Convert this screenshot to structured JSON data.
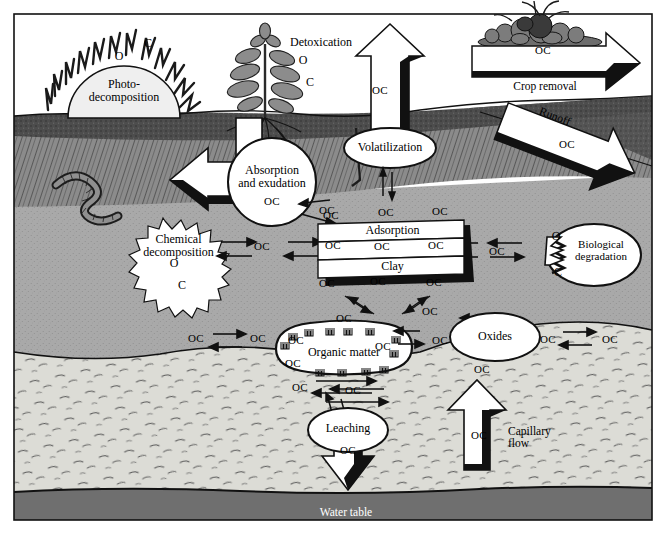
{
  "diagram": {
    "colors": {
      "surface_white": "#ffffff",
      "topsoil_dark": "#4a4a4a",
      "a_horizon": "#8e8e8e",
      "subsoil_mid": "#a8a8a8",
      "parent_material": "#d9d9d4",
      "water_table": "#6e6e6e",
      "outline": "#000000",
      "callout_fill": "#ffffff"
    },
    "layers": [
      {
        "name": "atmosphere",
        "label": ""
      },
      {
        "name": "topsoil",
        "label": ""
      },
      {
        "name": "a-horizon",
        "label": ""
      },
      {
        "name": "subsoil",
        "label": ""
      },
      {
        "name": "parent-material",
        "label": ""
      },
      {
        "name": "water-table",
        "label": "Water table"
      }
    ]
  },
  "processes": {
    "photo_decomposition": "Photo-\ndecomposition",
    "detoxication": "Detoxication",
    "volatilization": "Volatilization",
    "crop_removal": "Crop removal",
    "runoff": "Runoff",
    "absorption_exudation": "Absorption\nand exudation",
    "chemical_decomposition": "Chemical\ndecomposition",
    "adsorption": "Adsorption",
    "clay": "Clay",
    "biological_degradation": "Biological\ndegradation",
    "organic_matter": "Organic matter",
    "oxides": "Oxides",
    "leaching": "Leaching",
    "capillary_flow": "Capillary\nflow",
    "water_table": "Water table"
  },
  "atoms": {
    "o": "O",
    "c": "C"
  },
  "oc_label": "OC",
  "oc_labels": [
    {
      "id": "oc-volatilization-stack",
      "text": "OC",
      "x": 380,
      "y": 92
    },
    {
      "id": "oc-crop-removal",
      "text": "OC",
      "x": 543,
      "y": 52
    },
    {
      "id": "oc-runoff",
      "text": "OC",
      "x": 567,
      "y": 146
    },
    {
      "id": "oc-absorption",
      "text": "OC",
      "x": 272,
      "y": 203
    },
    {
      "id": "oc-absorption-right",
      "text": "OC",
      "x": 327,
      "y": 212
    },
    {
      "id": "oc-clay-top-left",
      "text": "OC",
      "x": 331,
      "y": 217
    },
    {
      "id": "oc-clay-top-mid",
      "text": "OC",
      "x": 386,
      "y": 214
    },
    {
      "id": "oc-clay-top-right",
      "text": "OC",
      "x": 440,
      "y": 213
    },
    {
      "id": "oc-chem-to-clay",
      "text": "OC",
      "x": 262,
      "y": 248
    },
    {
      "id": "oc-clay-row-left",
      "text": "OC",
      "x": 333,
      "y": 247
    },
    {
      "id": "oc-clay-row-mid",
      "text": "OC",
      "x": 382,
      "y": 248
    },
    {
      "id": "oc-clay-row-right",
      "text": "OC",
      "x": 436,
      "y": 247
    },
    {
      "id": "oc-clay-to-bio",
      "text": "OC",
      "x": 497,
      "y": 253
    },
    {
      "id": "oc-clay-bottom-left",
      "text": "OC",
      "x": 327,
      "y": 285
    },
    {
      "id": "oc-clay-bottom-mid",
      "text": "OC",
      "x": 378,
      "y": 283
    },
    {
      "id": "oc-clay-bottom-right",
      "text": "OC",
      "x": 434,
      "y": 284
    },
    {
      "id": "oc-om-upper-left",
      "text": "OC",
      "x": 344,
      "y": 320
    },
    {
      "id": "oc-om-upper-right",
      "text": "OC",
      "x": 430,
      "y": 313
    },
    {
      "id": "oc-left-of-om",
      "text": "OC",
      "x": 196,
      "y": 340
    },
    {
      "id": "oc-left-of-om2",
      "text": "OC",
      "x": 258,
      "y": 340
    },
    {
      "id": "oc-om-side-left",
      "text": "OC",
      "x": 296,
      "y": 342
    },
    {
      "id": "oc-om-inner-right",
      "text": "OC",
      "x": 383,
      "y": 348
    },
    {
      "id": "oc-om-inner-left",
      "text": "OC",
      "x": 293,
      "y": 365
    },
    {
      "id": "oc-oxides-left",
      "text": "OC",
      "x": 440,
      "y": 342
    },
    {
      "id": "oc-oxides-right",
      "text": "OC",
      "x": 548,
      "y": 341
    },
    {
      "id": "oc-oxides-far-right",
      "text": "OC",
      "x": 610,
      "y": 341
    },
    {
      "id": "oc-below-oxides",
      "text": "OC",
      "x": 482,
      "y": 371
    },
    {
      "id": "oc-om-below",
      "text": "OC",
      "x": 300,
      "y": 389
    },
    {
      "id": "oc-leach-side",
      "text": "OC",
      "x": 353,
      "y": 392
    },
    {
      "id": "oc-leaching",
      "text": "OC",
      "x": 348,
      "y": 452
    },
    {
      "id": "oc-capillary",
      "text": "OC",
      "x": 479,
      "y": 437
    }
  ],
  "atom_labels": [
    {
      "id": "c-photo",
      "text": "C",
      "x": 148,
      "y": 45
    },
    {
      "id": "o-photo",
      "text": "O",
      "x": 119,
      "y": 58
    },
    {
      "id": "o-detox",
      "text": "O",
      "x": 303,
      "y": 62
    },
    {
      "id": "c-detox",
      "text": "C",
      "x": 310,
      "y": 84
    },
    {
      "id": "o-chem",
      "text": "O",
      "x": 174,
      "y": 265
    },
    {
      "id": "c-chem",
      "text": "C",
      "x": 182,
      "y": 287
    },
    {
      "id": "o-bio",
      "text": "O",
      "x": 556,
      "y": 238
    },
    {
      "id": "c-bio",
      "text": "C",
      "x": 558,
      "y": 274
    }
  ]
}
